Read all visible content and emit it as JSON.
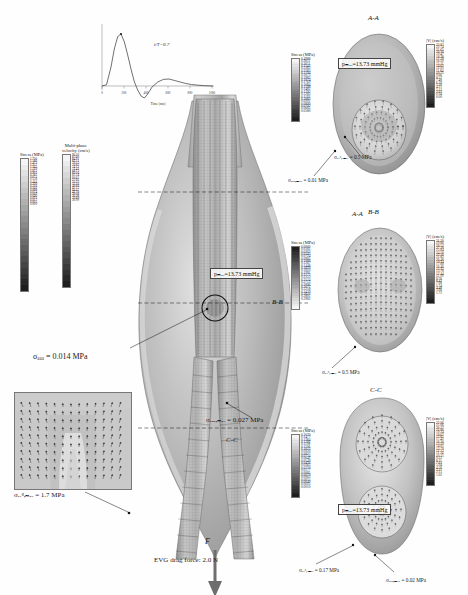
{
  "figure": {
    "domain_label": "FSI simulation of abdominal aortic aneurysm with endovascular graft"
  },
  "waveform": {
    "annotation": "t/T=0.7",
    "xlabel": "Time (ms)",
    "ylabel": "Flow rate",
    "xticks": [
      "0",
      "200",
      "400",
      "600",
      "800",
      "1000"
    ],
    "marker": "peak"
  },
  "chart_data": {
    "type": "line",
    "title": "",
    "xlabel": "Time (ms)",
    "ylabel": "Flow rate",
    "annotation": "t/T=0.7",
    "xlim": [
      0,
      1000
    ],
    "ylim": [
      -0.25,
      1.05
    ],
    "grid": false,
    "legend": "none",
    "x": [
      0,
      40,
      80,
      110,
      140,
      170,
      200,
      230,
      260,
      290,
      320,
      350,
      380,
      410,
      450,
      500,
      550,
      600,
      650,
      700,
      750,
      800,
      860,
      920,
      1000
    ],
    "y": [
      0.0,
      0.02,
      0.35,
      0.72,
      0.95,
      1.0,
      0.86,
      0.62,
      0.38,
      0.14,
      -0.06,
      -0.18,
      -0.22,
      -0.15,
      -0.02,
      0.07,
      0.11,
      0.12,
      0.1,
      0.07,
      0.04,
      0.02,
      0.01,
      0.005,
      0.0
    ]
  },
  "main_view": {
    "pressure_box": "pₘₐₓ=13.73 mmHg",
    "stress_colorbar": {
      "title": "Stress (MPa)",
      "values": [
        "1.700",
        "1.586",
        "1.472",
        "1.357",
        "1.243",
        "1.129",
        "1.015",
        "0.901",
        "0.787",
        "0.672",
        "0.558",
        "0.444",
        "0.330",
        "0.216",
        "0.102",
        "0.088",
        "0.074",
        "0.060",
        "0.046",
        "0.031",
        "0.017",
        "0.003",
        "0.000"
      ]
    },
    "velocity_colorbar": {
      "title": "Multi-phase",
      "subtitle": "velocity (cm/s)",
      "values": [
        "90.30",
        "87.60",
        "84.91",
        "82.21",
        "79.52",
        "76.82",
        "74.12",
        "71.43",
        "68.73",
        "66.04",
        "63.34",
        "60.65",
        "57.95",
        "55.25",
        "52.56",
        "49.86",
        "47.17",
        "44.47",
        "41.78",
        "39.08",
        "36.38",
        "33.69",
        "30.99"
      ]
    },
    "section_aa": "A-A",
    "section_bb": "B-B",
    "section_cc": "C-C",
    "force_label": "F",
    "drag_force": "EVG drag force: 2.0 N",
    "ann_aaa": "σₐₐₐ = 0.014 MPa",
    "ann_aaa_max": "σₐₐₐ,ₘₐₓ = 0.027 MPa",
    "ann_evg_max": "σₑᵥᵍ,ₘₐₓ = 1.7 MPa"
  },
  "panel_aa": {
    "title": "A-A",
    "pressure_box": "pₘₐₓ=13.73 mmHg",
    "left_colorbar_title": "Stress (MPa)",
    "left_values": [
      "0.4988",
      "0.2611",
      "0.2611",
      "0.2542",
      "0.2362",
      "0.2283",
      "0.2194",
      "0.2075",
      "0.1983",
      "0.1874",
      "0.1769",
      "0.1684",
      "0.1590",
      "0.1482",
      "0.1392",
      "0.1285",
      "0.1192",
      "0.1083",
      "0.0991",
      "0.0890",
      "0.0792",
      "0.0685",
      "0.0580"
    ],
    "right_colorbar_title": "|V| (cm/s)",
    "right_values": [
      "23.83",
      "22.74",
      "21.65",
      "20.56",
      "19.47",
      "18.38",
      "17.29",
      "16.20",
      "15.11",
      "14.02",
      "12.93",
      "11.84",
      "10.75",
      "9.66",
      "8.57",
      "7.48",
      "6.39",
      "5.30",
      "4.21",
      "3.12",
      "2.03",
      "0.94",
      "0.00"
    ],
    "ann_evg": "σₑᵥᵍ,ₘₐₓ = 0.5 MPa",
    "ann_aaa": "σₐₐₐ,ₘₐₓ = 0.01 MPa"
  },
  "panel_bb": {
    "title": "B-B",
    "left_colorbar_title": "Stress (MPa)",
    "left_values": [
      "0.0000",
      "0.0181",
      "0.0362",
      "0.0543",
      "0.0724",
      "0.0905",
      "0.1086",
      "0.1267",
      "0.1448",
      "0.1629",
      "0.1810",
      "0.1991",
      "0.2172",
      "0.2353",
      "0.2534",
      "0.2715",
      "0.2896",
      "0.3077",
      "0.3258",
      "0.3439",
      "0.3620",
      "0.3801",
      "0.3982"
    ],
    "right_colorbar_title": "|V| (cm/s)",
    "right_values": [
      "31.20",
      "29.86",
      "28.52",
      "27.18",
      "25.84",
      "24.50",
      "23.16",
      "21.82",
      "20.48",
      "19.14",
      "17.80",
      "16.46",
      "15.12",
      "13.78",
      "12.44",
      "11.10",
      "9.76",
      "8.42",
      "7.08",
      "5.74",
      "4.40",
      "3.06",
      "1.72"
    ],
    "ann_evg": "σₑᵥᵍ,ₘₐₓ = 0.5 MPa"
  },
  "panel_cc": {
    "title": "C-C",
    "pressure_box": "pₘₐₓ=13.73 mmHg",
    "left_colorbar_title": "Stress (MPa)",
    "left_values": [
      "0.1670",
      "0.1477",
      "0.1384",
      "0.1291",
      "0.1198",
      "0.1106",
      "0.1013",
      "0.0920",
      "0.0827",
      "0.0734",
      "0.0641",
      "0.0549",
      "0.0456",
      "0.0363",
      "0.0270",
      "0.0177",
      "0.0085",
      "0.0070",
      "0.0063",
      "0.0055",
      "0.0040",
      "0.0025",
      "0.0010"
    ],
    "right_colorbar_title": "|V| (cm/s)",
    "right_values": [
      "22.06",
      "21.06",
      "20.37",
      "21.06",
      "19.34",
      "18.62",
      "17.61",
      "17.42",
      "16.20",
      "15.19",
      "14.01",
      "13.79",
      "12.12",
      "11.34",
      "10.15",
      "9.23",
      "8.11",
      "7.03",
      "5.94",
      "4.56",
      "3.21",
      "2.15",
      "1.02"
    ],
    "ann_evg": "σₑᵥᵍ,ₘₐₓ = 0.17 MPa",
    "ann_aaa": "σₐₐₐ,ₘₐₓ = 0.02 MPa"
  },
  "inset": {
    "name": "velocity-vector-inset"
  },
  "colors": {
    "grey_dark": "#3a3a3a",
    "grey_mid": "#8e8e8e",
    "grey_light": "#cfcfcf",
    "line": "#222222",
    "bg": "#ffffff"
  }
}
